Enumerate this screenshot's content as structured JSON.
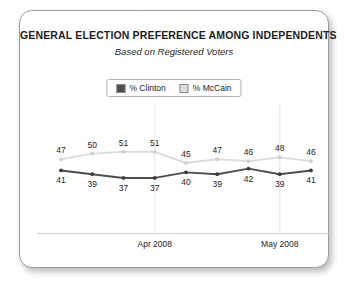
{
  "card": {
    "title": "GENERAL ELECTION PREFERENCE AMONG INDEPENDENTS",
    "subtitle": "Based on Registered Voters"
  },
  "legend": {
    "entries": [
      {
        "label": "% Clinton",
        "color": "#4d4d4d",
        "swatch": "clinton-swatch"
      },
      {
        "label": "% McCain",
        "color": "#dcdcdc",
        "swatch": "mccain-swatch"
      }
    ]
  },
  "chart_data": {
    "type": "line",
    "title": "GENERAL ELECTION PREFERENCE AMONG INDEPENDENTS",
    "subtitle": "Based on Registered Voters",
    "xlabel": "",
    "ylabel": "",
    "ylim": [
      30,
      60
    ],
    "grid": false,
    "legend_position": "top-center",
    "x": [
      1,
      2,
      3,
      4,
      5,
      6,
      7,
      8,
      9
    ],
    "tick_labels": [
      "",
      "",
      "",
      "Apr 2008",
      "",
      "",
      "",
      "May 2008",
      ""
    ],
    "gridline_indices": [
      3,
      7
    ],
    "series": [
      {
        "name": "% Clinton",
        "color": "#4d4d4d",
        "values": [
          41,
          39,
          37,
          37,
          40,
          39,
          42,
          39,
          41
        ],
        "label_positions": [
          "below",
          "below",
          "below",
          "below",
          "below",
          "below",
          "below",
          "below",
          "below"
        ]
      },
      {
        "name": "% McCain",
        "color": "#dcdcdc",
        "values": [
          47,
          50,
          51,
          51,
          45,
          47,
          46,
          48,
          46
        ],
        "label_positions": [
          "above",
          "above",
          "above",
          "above",
          "above",
          "above",
          "above",
          "above",
          "above"
        ]
      }
    ]
  },
  "axis": {
    "ticks": [
      {
        "label": "Apr 2008",
        "index": 3
      },
      {
        "label": "May 2008",
        "index": 7
      }
    ]
  }
}
